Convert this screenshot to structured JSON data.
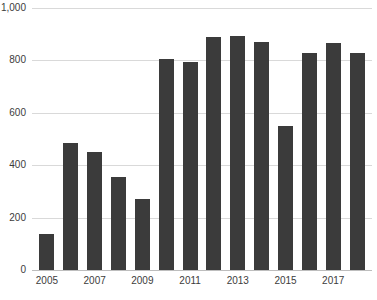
{
  "chart_data": {
    "type": "bar",
    "title": "",
    "subtitle": "",
    "xlabel": "",
    "ylabel": "",
    "categories": [
      "2005",
      "2006",
      "2007",
      "2008",
      "2009",
      "2010",
      "2011",
      "2012",
      "2013",
      "2014",
      "2015",
      "2016",
      "2017",
      "2018"
    ],
    "values": [
      137,
      485,
      452,
      355,
      271,
      805,
      795,
      890,
      893,
      870,
      550,
      828,
      865,
      830
    ],
    "ylim": [
      0,
      1000
    ],
    "yticks": [
      0,
      200,
      400,
      600,
      800,
      1000
    ],
    "ytick_labels": [
      "0",
      "200",
      "400",
      "600",
      "800",
      "1,000"
    ],
    "xtick_labels": [
      "2005",
      "",
      "2007",
      "",
      "2009",
      "",
      "2011",
      "",
      "2013",
      "",
      "2015",
      "",
      "2017",
      ""
    ],
    "grid": true,
    "legend": false,
    "legend_position": "none",
    "series": [
      {
        "name": "",
        "values": [
          137,
          485,
          452,
          355,
          271,
          805,
          795,
          890,
          893,
          870,
          550,
          828,
          865,
          830
        ]
      }
    ],
    "colors": {
      "bar": "#3b3b3b",
      "gridline": "#d9d9d9",
      "axis": "#bdbdbd",
      "tick_text": "#3c3c3c",
      "background": "#ffffff"
    }
  }
}
